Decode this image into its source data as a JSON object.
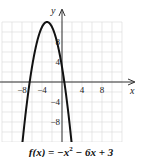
{
  "chart_data": {
    "type": "line",
    "title": "",
    "caption": "f(x) = −x² − 6x + 3",
    "xlabel": "x",
    "ylabel": "y",
    "xlim": [
      -12,
      12
    ],
    "ylim": [
      -12,
      12
    ],
    "grid": true,
    "grid_step": 2,
    "x_ticks": [
      -8,
      -4,
      4,
      8
    ],
    "y_ticks": [
      8,
      4,
      -4,
      -8
    ],
    "x_tick_labels": [
      "−8",
      "−4",
      "4",
      "8"
    ],
    "y_tick_labels": [
      "8",
      "4",
      "−4",
      "−8"
    ],
    "series": [
      {
        "name": "f(x) = -x^2 - 6x + 3",
        "function": "-x^2 - 6x + 3",
        "vertex": [
          -3,
          12
        ],
        "x_intercepts": [
          -6.46,
          0.46
        ],
        "y_intercept": 3,
        "x": [
          -8,
          -7,
          -6,
          -5,
          -4,
          -3,
          -2,
          -1,
          0,
          1,
          2
        ],
        "values": [
          -13,
          -4,
          3,
          8,
          11,
          12,
          11,
          8,
          3,
          -4,
          -13
        ]
      }
    ]
  },
  "labels": {
    "x_axis": "x",
    "y_axis": "y",
    "caption_lhs": "f(x) = −x",
    "caption_exp": "2",
    "caption_rhs": " − 6x + 3"
  },
  "colors": {
    "curve": "#111111",
    "axis": "#333333",
    "grid": "#d9d9d9",
    "text": "#222222"
  }
}
